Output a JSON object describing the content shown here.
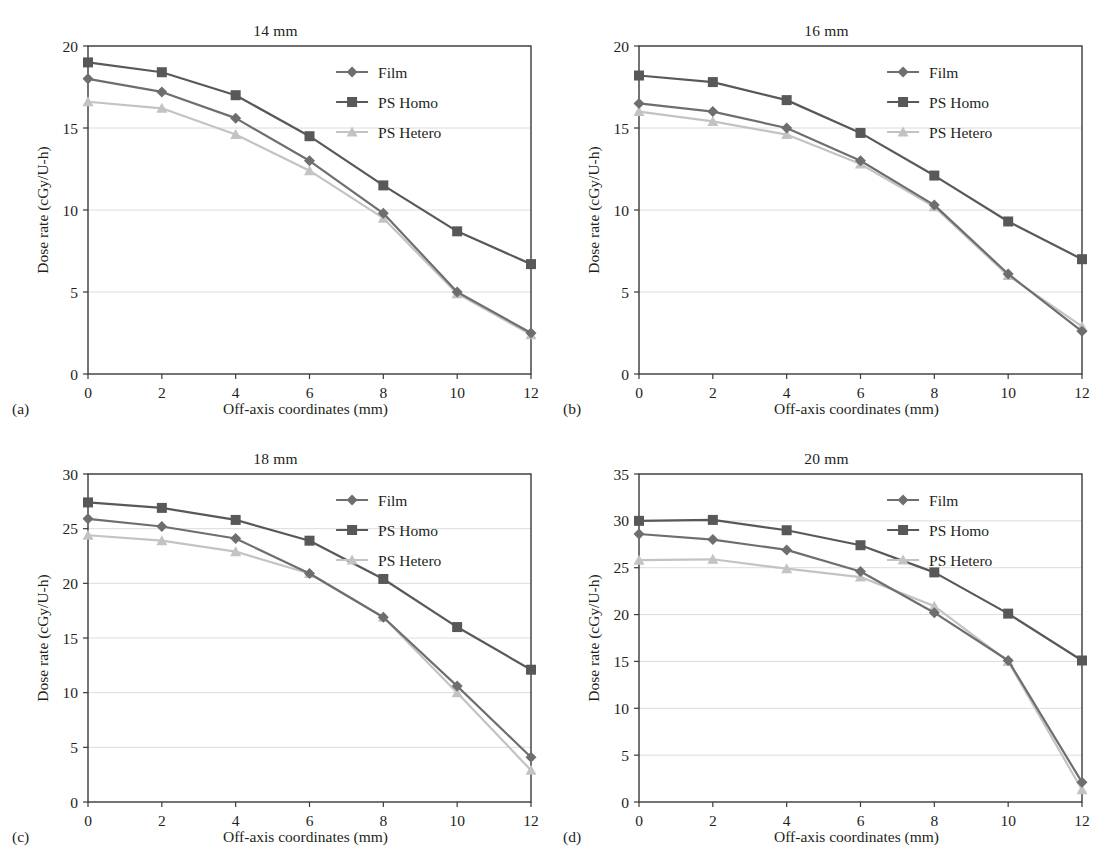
{
  "figure": {
    "series_colors": {
      "film": "#6e6e6e",
      "ps_homo": "#585858",
      "ps_hetero": "#c3c3c3",
      "axis": "#3a3a3a",
      "grid": "#dcdcdc"
    },
    "legend_labels": {
      "film": "Film",
      "ps_homo": "PS Homo",
      "ps_hetero": "PS Hetero"
    },
    "axis_titles": {
      "x": "Off-axis coordinates (mm)",
      "y": "Dose rate (cGy/U-h)"
    },
    "panel_labels": {
      "a": "(a)",
      "b": "(b)",
      "c": "(c)",
      "d": "(d)"
    }
  },
  "chart_data": [
    {
      "type": "line",
      "panel": "(a)",
      "title": "14 mm",
      "xlabel": "Off-axis coordinates (mm)",
      "ylabel": "Dose rate (cGy/U-h)",
      "x": [
        0,
        2,
        4,
        6,
        8,
        10,
        12
      ],
      "xlim": [
        0,
        12
      ],
      "ylim": [
        0,
        20
      ],
      "xticks": [
        0,
        2,
        4,
        6,
        8,
        10,
        12
      ],
      "yticks": [
        0,
        5,
        10,
        15,
        20
      ],
      "grid": true,
      "legend_position": "top-right",
      "series": [
        {
          "name": "Film",
          "values": [
            18.0,
            17.2,
            15.6,
            13.0,
            9.8,
            5.0,
            2.5
          ]
        },
        {
          "name": "PS Homo",
          "values": [
            19.0,
            18.4,
            17.0,
            14.5,
            11.5,
            8.7,
            6.7
          ]
        },
        {
          "name": "PS Hetero",
          "values": [
            16.6,
            16.2,
            14.6,
            12.4,
            9.5,
            4.9,
            2.4
          ]
        }
      ]
    },
    {
      "type": "line",
      "panel": "(b)",
      "title": "16 mm",
      "xlabel": "Off-axis coordinates (mm)",
      "ylabel": "Dose rate (cGy/U-h)",
      "x": [
        0,
        2,
        4,
        6,
        8,
        10,
        12
      ],
      "xlim": [
        0,
        12
      ],
      "ylim": [
        0,
        20
      ],
      "xticks": [
        0,
        2,
        4,
        6,
        8,
        10,
        12
      ],
      "yticks": [
        0,
        5,
        10,
        15,
        20
      ],
      "grid": true,
      "legend_position": "top-right",
      "series": [
        {
          "name": "Film",
          "values": [
            16.5,
            16.0,
            15.0,
            13.0,
            10.3,
            6.1,
            2.6
          ]
        },
        {
          "name": "PS Homo",
          "values": [
            18.2,
            17.8,
            16.7,
            14.7,
            12.1,
            9.3,
            7.0
          ]
        },
        {
          "name": "PS Hetero",
          "values": [
            16.0,
            15.4,
            14.6,
            12.8,
            10.2,
            6.0,
            2.9
          ]
        }
      ]
    },
    {
      "type": "line",
      "panel": "(c)",
      "title": "18 mm",
      "xlabel": "Off-axis coordinates (mm)",
      "ylabel": "Dose rate (cGy/U-h)",
      "x": [
        0,
        2,
        4,
        6,
        8,
        10,
        12
      ],
      "xlim": [
        0,
        12
      ],
      "ylim": [
        0,
        30
      ],
      "xticks": [
        0,
        2,
        4,
        6,
        8,
        10,
        12
      ],
      "yticks": [
        0,
        5,
        10,
        15,
        20,
        25,
        30
      ],
      "grid": true,
      "legend_position": "top-right",
      "series": [
        {
          "name": "Film",
          "values": [
            25.9,
            25.2,
            24.1,
            20.9,
            16.9,
            10.6,
            4.1
          ]
        },
        {
          "name": "PS Homo",
          "values": [
            27.4,
            26.9,
            25.8,
            23.9,
            20.4,
            16.0,
            12.1
          ]
        },
        {
          "name": "PS Hetero",
          "values": [
            24.4,
            23.9,
            22.9,
            20.9,
            16.9,
            10.0,
            2.9
          ]
        }
      ]
    },
    {
      "type": "line",
      "panel": "(d)",
      "title": "20 mm",
      "xlabel": "Off-axis coordinates (mm)",
      "ylabel": "Dose rate (cGy/U-h)",
      "x": [
        0,
        2,
        4,
        6,
        8,
        10,
        12
      ],
      "xlim": [
        0,
        12
      ],
      "ylim": [
        0,
        35
      ],
      "xticks": [
        0,
        2,
        4,
        6,
        8,
        10,
        12
      ],
      "yticks": [
        0,
        5,
        10,
        15,
        20,
        25,
        30,
        35
      ],
      "grid": true,
      "legend_position": "top-right",
      "series": [
        {
          "name": "Film",
          "values": [
            28.6,
            28.0,
            26.9,
            24.6,
            20.2,
            15.1,
            2.1
          ]
        },
        {
          "name": "PS Homo",
          "values": [
            30.0,
            30.1,
            29.0,
            27.4,
            24.5,
            20.1,
            15.1
          ]
        },
        {
          "name": "PS Hetero",
          "values": [
            25.8,
            25.9,
            24.9,
            24.0,
            20.9,
            15.0,
            1.3
          ]
        }
      ]
    }
  ]
}
